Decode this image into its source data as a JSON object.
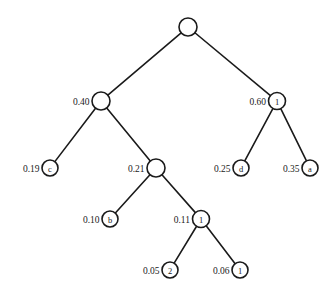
{
  "figure": {
    "type": "tree-diagram",
    "title": "",
    "background_color": "#ffffff",
    "stroke_color": "#1a1a1a",
    "node_fill_color": "#ffffff"
  },
  "chart_data": {
    "type": "tree",
    "title": "",
    "nodes": [
      {
        "id": "root",
        "label": "",
        "weight": "",
        "x": 188,
        "y": 27,
        "r": 9,
        "kind": "internal"
      },
      {
        "id": "n040",
        "label": "",
        "weight": "0.40",
        "x": 101,
        "y": 101,
        "r": 9,
        "kind": "internal"
      },
      {
        "id": "n060",
        "label": "1",
        "weight": "0.60",
        "x": 277,
        "y": 101,
        "r": 8.5,
        "kind": "internal"
      },
      {
        "id": "n019",
        "label": "c",
        "weight": "0.19",
        "x": 50,
        "y": 168,
        "r": 8,
        "kind": "leaf"
      },
      {
        "id": "n021",
        "label": "",
        "weight": "0.21",
        "x": 156,
        "y": 168,
        "r": 9,
        "kind": "internal"
      },
      {
        "id": "n025",
        "label": "d",
        "weight": "0.25",
        "x": 241,
        "y": 168,
        "r": 8,
        "kind": "leaf"
      },
      {
        "id": "n035",
        "label": "a",
        "weight": "0.35",
        "x": 310,
        "y": 168,
        "r": 8,
        "kind": "leaf"
      },
      {
        "id": "n010",
        "label": "b",
        "weight": "0.10",
        "x": 110,
        "y": 219,
        "r": 8,
        "kind": "leaf"
      },
      {
        "id": "n011",
        "label": "1",
        "weight": "0.11",
        "x": 201,
        "y": 219,
        "r": 8.5,
        "kind": "internal"
      },
      {
        "id": "n005",
        "label": "2",
        "weight": "0.05",
        "x": 170,
        "y": 270,
        "r": 8,
        "kind": "leaf"
      },
      {
        "id": "n006",
        "label": "1",
        "weight": "0.06",
        "x": 240,
        "y": 270,
        "r": 8,
        "kind": "leaf"
      }
    ],
    "edges": [
      {
        "from": "root",
        "to": "n040"
      },
      {
        "from": "root",
        "to": "n060"
      },
      {
        "from": "n040",
        "to": "n019"
      },
      {
        "from": "n040",
        "to": "n021"
      },
      {
        "from": "n060",
        "to": "n025"
      },
      {
        "from": "n060",
        "to": "n035"
      },
      {
        "from": "n021",
        "to": "n010"
      },
      {
        "from": "n021",
        "to": "n011"
      },
      {
        "from": "n011",
        "to": "n005"
      },
      {
        "from": "n011",
        "to": "n006"
      }
    ],
    "weights": [
      "0.40",
      "0.60",
      "0.19",
      "0.21",
      "0.25",
      "0.35",
      "0.10",
      "0.11",
      "0.05",
      "0.06"
    ],
    "node_labels": [
      "1",
      "c",
      "d",
      "a",
      "b",
      "1",
      "2",
      "1"
    ],
    "leaf_symbols": [
      "c",
      "d",
      "a",
      "b",
      "2",
      "1"
    ]
  }
}
